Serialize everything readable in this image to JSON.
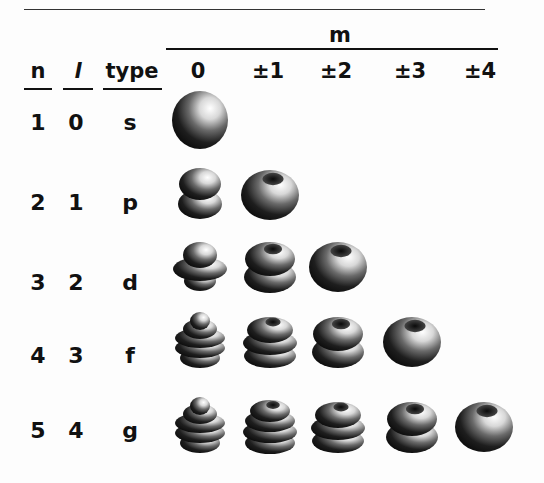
{
  "header": {
    "group_label": "m",
    "columns": {
      "n": "n",
      "l": "l",
      "type": "type"
    },
    "m_values": [
      "0",
      "±1",
      "±2",
      "±3",
      "±4"
    ]
  },
  "rows": [
    {
      "n": "1",
      "l": "0",
      "type": "s",
      "orbitals": [
        {
          "m": "0",
          "shape": "sphere"
        }
      ]
    },
    {
      "n": "2",
      "l": "1",
      "type": "p",
      "orbitals": [
        {
          "m": "0",
          "shape": "two-lobes"
        },
        {
          "m": "±1",
          "shape": "torus"
        }
      ]
    },
    {
      "n": "3",
      "l": "2",
      "type": "d",
      "orbitals": [
        {
          "m": "0",
          "shape": "lobes-with-ring"
        },
        {
          "m": "±1",
          "shape": "double-torus"
        },
        {
          "m": "±2",
          "shape": "torus"
        }
      ]
    },
    {
      "n": "4",
      "l": "3",
      "type": "f",
      "orbitals": [
        {
          "m": "0",
          "shape": "stacked-rings"
        },
        {
          "m": "±1",
          "shape": "triple-torus"
        },
        {
          "m": "±2",
          "shape": "double-torus"
        },
        {
          "m": "±3",
          "shape": "torus"
        }
      ]
    },
    {
      "n": "5",
      "l": "4",
      "type": "g",
      "orbitals": [
        {
          "m": "0",
          "shape": "stacked-rings"
        },
        {
          "m": "±1",
          "shape": "quad-torus"
        },
        {
          "m": "±2",
          "shape": "triple-torus"
        },
        {
          "m": "±3",
          "shape": "double-torus"
        },
        {
          "m": "±4",
          "shape": "torus"
        }
      ]
    }
  ]
}
